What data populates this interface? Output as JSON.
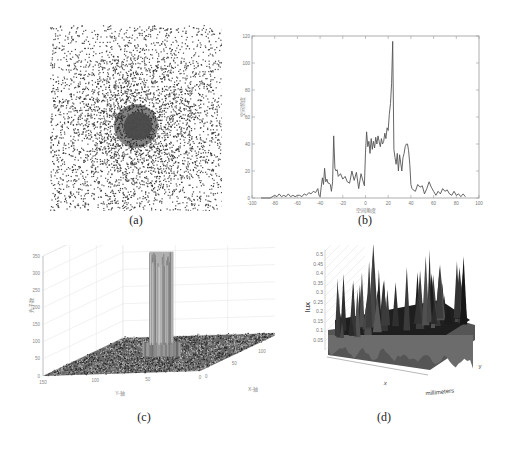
{
  "figure": {
    "captions": {
      "a": "(a)",
      "b": "(b)",
      "c": "(c)",
      "d": "(d)"
    }
  },
  "chart_data": [
    {
      "id": "a",
      "type": "heatmap",
      "title": "",
      "description": "Speckle scatter image, dense dark disk at center fading radially outward",
      "colors": {
        "dot": "#2a2a2a",
        "center": "#4a4a4a"
      }
    },
    {
      "id": "b",
      "type": "line",
      "title": "",
      "xlabel": "空间角度",
      "ylabel": "空间频度",
      "xlim": [
        -100,
        100
      ],
      "ylim": [
        0,
        120
      ],
      "xticks": [
        -100,
        -80,
        -60,
        -40,
        -20,
        0,
        20,
        40,
        60,
        80,
        100
      ],
      "yticks": [
        0,
        20,
        40,
        60,
        80,
        100,
        120
      ],
      "grid": false,
      "series": [
        {
          "name": "profile",
          "color": "#555555",
          "x": [
            -92,
            -88,
            -84,
            -80,
            -78,
            -76,
            -74,
            -72,
            -70,
            -68,
            -66,
            -64,
            -62,
            -60,
            -58,
            -56,
            -54,
            -52,
            -50,
            -48,
            -46,
            -44,
            -42,
            -41,
            -40,
            -39,
            -38,
            -37,
            -36,
            -35,
            -34,
            -33,
            -32,
            -31,
            -30,
            -29,
            -28,
            -27,
            -26,
            -25,
            -24,
            -22,
            -20,
            -18,
            -16,
            -14,
            -12,
            -10,
            -8,
            -6,
            -4,
            -2,
            -1,
            0,
            1,
            2,
            3,
            4,
            5,
            6,
            7,
            8,
            9,
            10,
            11,
            12,
            13,
            14,
            15,
            16,
            17,
            18,
            19,
            20,
            21,
            22,
            23,
            24,
            25,
            26,
            27,
            28,
            29,
            30,
            31,
            32,
            33,
            34,
            35,
            36,
            37,
            38,
            39,
            40,
            41,
            42,
            44,
            46,
            48,
            50,
            52,
            54,
            56,
            58,
            60,
            62,
            64,
            66,
            68,
            70,
            72,
            74,
            76,
            78,
            80,
            82,
            84,
            86,
            88
          ],
          "y": [
            0,
            0,
            0,
            2,
            1,
            3,
            1,
            2,
            1,
            3,
            1,
            2,
            1,
            2,
            2,
            1,
            3,
            2,
            4,
            3,
            5,
            4,
            7,
            2,
            1,
            8,
            15,
            10,
            22,
            12,
            14,
            11,
            11,
            10,
            5,
            12,
            46,
            22,
            20,
            21,
            16,
            18,
            14,
            16,
            12,
            11,
            20,
            13,
            19,
            7,
            18,
            12,
            9,
            34,
            49,
            38,
            42,
            33,
            44,
            36,
            42,
            37,
            45,
            40,
            46,
            42,
            38,
            44,
            40,
            42,
            48,
            44,
            52,
            50,
            62,
            70,
            85,
            116,
            36,
            30,
            25,
            33,
            20,
            32,
            26,
            20,
            30,
            33,
            38,
            40,
            40,
            35,
            25,
            10,
            7,
            6,
            5,
            10,
            8,
            9,
            3,
            7,
            12,
            8,
            5,
            2,
            5,
            3,
            7,
            5,
            6,
            3,
            2,
            5,
            2,
            3,
            1,
            3,
            1
          ]
        }
      ]
    },
    {
      "id": "c",
      "type": "area",
      "subtype": "3d-surface",
      "title": "",
      "xlabel": "X-轴",
      "ylabel": "Y-轴",
      "zlabel": "光子数",
      "xlim": [
        0,
        150
      ],
      "ylim": [
        0,
        150
      ],
      "zlim": [
        0,
        350
      ],
      "xticks": [
        0,
        50,
        100,
        150
      ],
      "yticks": [
        0,
        50,
        100,
        150
      ],
      "zticks": [
        0,
        50,
        100,
        150,
        200,
        250,
        300,
        350
      ],
      "grid": true,
      "peak_height": 300,
      "base_height": 40
    },
    {
      "id": "d",
      "type": "area",
      "subtype": "3d-surface",
      "title": "",
      "xlabel": "x",
      "ylabel": "y",
      "zlabel": "lux",
      "unit_label": "millimeters",
      "zticks": [
        "0.05",
        "0.1",
        "0.15",
        "0.2",
        "0.25",
        "0.3",
        "0.35",
        "0.4",
        "0.45",
        "0.5"
      ],
      "grid": true
    }
  ]
}
